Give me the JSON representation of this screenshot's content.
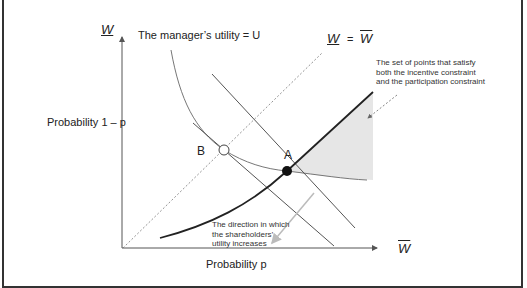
{
  "diagram": {
    "axes": {
      "y_label_symbol": "W",
      "y_label_text": "Probability 1 – p",
      "x_label_symbol": "W",
      "x_label_text": "Probability p"
    },
    "labels": {
      "manager_utility": "The manager’s utility = U",
      "line_eq_left": "W",
      "line_eq_eq": "=",
      "line_eq_right": "W",
      "feasible_set_line1": "The set of points that satisfy",
      "feasible_set_line2": "both the incentive constraint",
      "feasible_set_line3": "and the participation constraint",
      "direction_line1": "The direction in which",
      "direction_line2": "the shareholders’",
      "direction_line3": "utility increases",
      "point_a": "A",
      "point_b": "B"
    },
    "colors": {
      "axis": "#555555",
      "curve": "#777777",
      "constraint": "#222222",
      "shade": "#e6e6e6",
      "arrow": "#bbbbbb"
    }
  }
}
